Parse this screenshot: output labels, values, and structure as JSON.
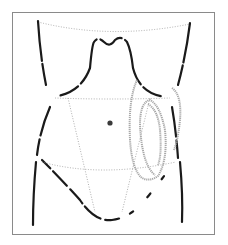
{
  "diagram": {
    "type": "anatomical-abdomen-outline",
    "colors": {
      "background": "#ffffff",
      "frame": "#8a8a8a",
      "outline": "#1a1a1a",
      "dotted_lines": "#9a9a9a",
      "loop": "#a8a8a8",
      "navel": "#3a3a3a"
    },
    "elements": [
      "frame",
      "torso-outline",
      "chest-upper-line",
      "costal-margins",
      "transverse-line-upper",
      "transverse-line-lower",
      "inguinal-lines",
      "navel",
      "looped-structure"
    ]
  }
}
